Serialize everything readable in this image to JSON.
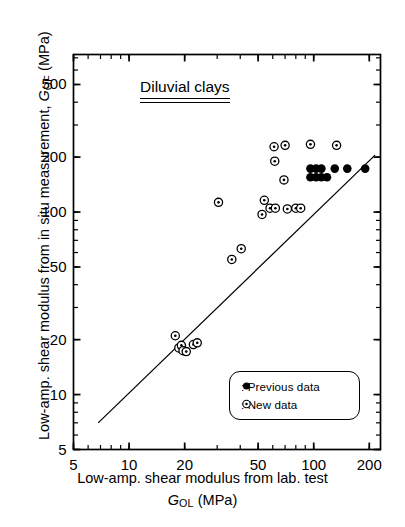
{
  "chart_data": {
    "type": "scatter",
    "title": "Diluvial clays",
    "xlabel_line1": "Low-amp. shear modulus from lab. test",
    "xlabel_symbol": "G",
    "xlabel_sub": "OL",
    "xlabel_units": "(MPa)",
    "ylabel_text": "Low-amp. shear modulus from in situ measurement,",
    "ylabel_symbol": "G",
    "ylabel_sub": "OF",
    "ylabel_units": "(MPa)",
    "xscale": "log",
    "yscale": "log",
    "xlim": [
      5,
      230
    ],
    "ylim": [
      5,
      730
    ],
    "xticks": [
      5,
      10,
      20,
      50,
      100,
      200
    ],
    "yticks": [
      5,
      10,
      20,
      50,
      100,
      200,
      500
    ],
    "grid": false,
    "reference_line": {
      "label": "1:1 line",
      "x": [
        6.8,
        215
      ],
      "y": [
        7.0,
        205
      ]
    },
    "legend_position": "lower-right",
    "series": [
      {
        "name": "Previous data",
        "marker": "filled-circle",
        "color": "#000000",
        "points": [
          [
            96,
            173
          ],
          [
            103,
            173
          ],
          [
            110,
            173
          ],
          [
            96,
            155
          ],
          [
            103,
            155
          ],
          [
            110,
            155
          ],
          [
            118,
            155
          ],
          [
            130,
            173
          ],
          [
            152,
            173
          ],
          [
            190,
            173
          ]
        ]
      },
      {
        "name": "New data",
        "marker": "open-circle-dot",
        "color": "#000000",
        "points": [
          [
            17.8,
            21.0
          ],
          [
            18.6,
            18.0
          ],
          [
            19.2,
            18.6
          ],
          [
            19.6,
            17.4
          ],
          [
            20.4,
            17.2
          ],
          [
            22.3,
            18.8
          ],
          [
            23.4,
            19.2
          ],
          [
            36.0,
            55.0
          ],
          [
            40.5,
            63.0
          ],
          [
            30.5,
            113.0
          ],
          [
            52.5,
            97.0
          ],
          [
            54.0,
            116.0
          ],
          [
            58.0,
            105.0
          ],
          [
            62.0,
            105.0
          ],
          [
            72.0,
            104.0
          ],
          [
            80.0,
            105.0
          ],
          [
            85.0,
            105.0
          ],
          [
            69.0,
            150.0
          ],
          [
            61.5,
            190.0
          ],
          [
            61.0,
            228.0
          ],
          [
            70.0,
            232.0
          ],
          [
            96.0,
            235.0
          ],
          [
            133.0,
            232.0
          ]
        ]
      }
    ]
  },
  "legend": {
    "items": [
      {
        "marker": "filled-circle",
        "label": ": Previous data"
      },
      {
        "marker": "open-circle-dot",
        "label": ": New  data"
      }
    ]
  }
}
